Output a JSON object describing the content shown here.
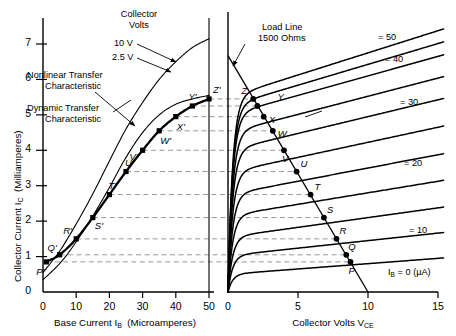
{
  "figure": {
    "background": "#ffffff",
    "ink": "#000000",
    "dash_color": "#8a8a8a"
  },
  "left_panel": {
    "y_axis": {
      "label": "Collector Current I_C  (Milliamperes)",
      "label_main": "Collector Current I",
      "label_sub": "C",
      "label_unit": "(Milliamperes)",
      "ticks": [
        0,
        1,
        2,
        3,
        4,
        5,
        6,
        7
      ],
      "min": 0,
      "max": 7.6
    },
    "x_axis": {
      "label_main": "Base Current I",
      "label_sub": "B",
      "label_unit": "(Microamperes)",
      "ticks": [
        0,
        10,
        20,
        30,
        40,
        50
      ],
      "min": 0,
      "max": 52
    },
    "annotations": [
      {
        "name": "collector-volts-title",
        "text": "Collector"
      },
      {
        "name": "collector-volts-title2",
        "text": "Volts"
      },
      {
        "name": "collector-volts-10v",
        "text": "10 V"
      },
      {
        "name": "collector-volts-25v",
        "text": "2.5 V"
      },
      {
        "name": "nonlinear-transfer-line1",
        "text": "Nonlinear Transfer"
      },
      {
        "name": "nonlinear-transfer-line2",
        "text": "Characteristic"
      },
      {
        "name": "dynamic-transfer-line1",
        "text": "Dynamic Transfer"
      },
      {
        "name": "dynamic-transfer-line2",
        "text": "Characteristic"
      }
    ],
    "point_labels": [
      "P'",
      "Q'",
      "R'",
      "S'",
      "T'",
      "U'",
      "V'",
      "W'",
      "X'",
      "Y'",
      "Z'"
    ]
  },
  "right_panel": {
    "x_axis": {
      "label_main": "Collector Volts V",
      "label_sub": "CE",
      "ticks": [
        0,
        5,
        10,
        15
      ],
      "min": 0,
      "max": 15.5
    },
    "annotations": [
      {
        "name": "load-line-line1",
        "text": "Load Line"
      },
      {
        "name": "load-line-line2",
        "text": "1500 Ohms"
      }
    ],
    "curve_labels": [
      "= 50",
      "= 40",
      "= 30",
      "= 20",
      "= 10"
    ],
    "zero_curve_label_main": "I",
    "zero_curve_label_sub": "B",
    "zero_curve_label_rest": "= 0 (µA)",
    "point_labels": [
      "P",
      "Q",
      "R",
      "S",
      "T",
      "U",
      "V",
      "W",
      "X",
      "Y",
      "Z"
    ]
  },
  "chart_data": {
    "type": "line",
    "panels": [
      {
        "name": "transfer-characteristics",
        "xlabel": "Base Current I_B (Microamperes)",
        "ylabel": "Collector Current I_C (Milliamperes)",
        "xlim": [
          0,
          52
        ],
        "ylim": [
          0,
          7.6
        ],
        "xticks": [
          0,
          10,
          20,
          30,
          40,
          50
        ],
        "yticks": [
          0,
          1,
          2,
          3,
          4,
          5,
          6,
          7
        ],
        "grid": false,
        "series": [
          {
            "name": "Nonlinear Transfer Characteristic (10 V)",
            "note": "Collector Volts = 10 V",
            "x": [
              0,
              2,
              5,
              8,
              12,
              16,
              20,
              25,
              30,
              35,
              40,
              45,
              50
            ],
            "y": [
              0.55,
              0.78,
              1.15,
              1.6,
              2.25,
              2.95,
              3.7,
              4.6,
              5.35,
              6.0,
              6.5,
              6.9,
              7.15
            ]
          },
          {
            "name": "Nonlinear Transfer Characteristic (2.5 V)",
            "note": "Collector Volts = 2.5 V",
            "x": [
              0,
              2,
              5,
              8,
              12,
              16,
              20,
              25,
              30,
              35,
              40,
              45,
              50
            ],
            "y": [
              0.35,
              0.52,
              0.8,
              1.15,
              1.7,
              2.3,
              2.95,
              3.8,
              4.5,
              5.0,
              5.3,
              5.45,
              5.55
            ]
          },
          {
            "name": "Dynamic Transfer Characteristic",
            "note": "Locus of load-line intersections P' through Z'",
            "x": [
              1,
              5,
              10,
              15,
              20,
              25,
              30,
              35,
              40,
              45,
              50
            ],
            "y": [
              0.85,
              1.05,
              1.5,
              2.1,
              2.75,
              3.4,
              4.0,
              4.55,
              4.95,
              5.25,
              5.45
            ],
            "markers": [
              "P'",
              "Q'",
              "R'",
              "S'",
              "T'",
              "U'",
              "V'",
              "W'",
              "X'",
              "Y'",
              "Z'"
            ]
          }
        ]
      },
      {
        "name": "collector-characteristics",
        "xlabel": "Collector Volts V_CE",
        "ylabel": "Collector Current I_C (Milliamperes)",
        "xlim": [
          0,
          15.5
        ],
        "ylim": [
          0,
          7.6
        ],
        "xticks": [
          0,
          5,
          10,
          15
        ],
        "grid": false,
        "load_line": {
          "name": "Load Line 1500 Ohms",
          "resistance_ohms": 1500,
          "supply_volts": 10,
          "x": [
            0,
            10
          ],
          "y": [
            6.67,
            0
          ]
        },
        "family": {
          "parameter": "I_B",
          "unit": "µA",
          "curves": [
            {
              "label": "I_B = 0 (µA)",
              "ib": 0,
              "knee_y": 0.5,
              "slope": 0.03
            },
            {
              "label": "= 10",
              "ib": 10,
              "knee_y": 1.55,
              "slope": 0.055
            },
            {
              "label": "= 20",
              "ib": 20,
              "knee_y": 2.75,
              "slope": 0.075
            },
            {
              "label": "= 30",
              "ib": 30,
              "knee_y": 4.0,
              "slope": 0.095
            },
            {
              "label": "= 40",
              "ib": 40,
              "knee_y": 5.0,
              "slope": 0.11
            },
            {
              "label": "= 50",
              "ib": 50,
              "knee_y": 5.5,
              "slope": 0.125
            }
          ],
          "intermediate_ib": [
            5,
            15,
            25,
            35,
            45
          ]
        },
        "operating_points": [
          {
            "label": "P",
            "ib": 1,
            "vce": 8.75,
            "ic": 0.85
          },
          {
            "label": "Q",
            "ib": 5,
            "vce": 8.45,
            "ic": 1.05
          },
          {
            "label": "R",
            "ib": 10,
            "vce": 7.75,
            "ic": 1.5
          },
          {
            "label": "S",
            "ib": 15,
            "vce": 6.85,
            "ic": 2.1
          },
          {
            "label": "T",
            "ib": 20,
            "vce": 5.9,
            "ic": 2.75
          },
          {
            "label": "U",
            "ib": 25,
            "vce": 4.9,
            "ic": 3.4
          },
          {
            "label": "V",
            "ib": 30,
            "vce": 4.0,
            "ic": 4.0
          },
          {
            "label": "W",
            "ib": 35,
            "vce": 3.2,
            "ic": 4.55
          },
          {
            "label": "X",
            "ib": 40,
            "vce": 2.55,
            "ic": 4.95
          },
          {
            "label": "Y",
            "ib": 45,
            "vce": 2.1,
            "ic": 5.25
          },
          {
            "label": "Z",
            "ib": 50,
            "vce": 1.8,
            "ic": 5.45
          }
        ],
        "tie_lines_ic": [
          0.85,
          1.05,
          1.5,
          2.1,
          2.75,
          3.4,
          4.0,
          4.55,
          4.95,
          5.25,
          5.45
        ]
      }
    ]
  }
}
